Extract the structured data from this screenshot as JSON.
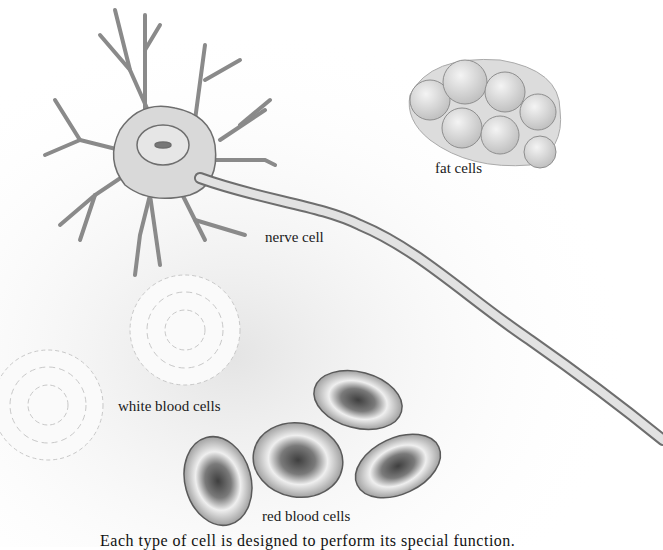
{
  "illustration": {
    "labels": {
      "nerve_cell": "nerve cell",
      "fat_cells": "fat cells",
      "white_blood_cells": "white blood cells",
      "red_blood_cells": "red blood cells"
    },
    "caption_partial": "Each type of cell is designed to perform its special function."
  },
  "colors": {
    "background": "#ffffff",
    "ink": "#6e6e6e",
    "shade": "#bdbdbd",
    "rbc_core": "#555555"
  }
}
